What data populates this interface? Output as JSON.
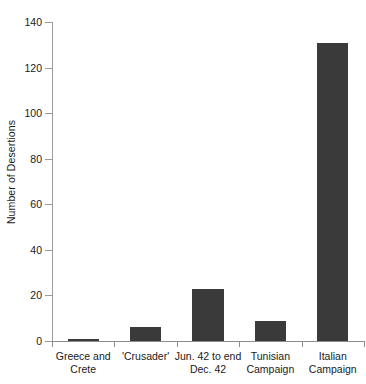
{
  "chart_data": {
    "type": "bar",
    "title": "",
    "xlabel": "",
    "ylabel": "Number of Desertions",
    "ylim": [
      0,
      140
    ],
    "yticks": [
      0,
      20,
      40,
      60,
      80,
      100,
      120,
      140
    ],
    "grid": false,
    "legend": null,
    "bar_color": "#3a3a3a",
    "axis_color": "#8c8c8c",
    "categories": [
      "Greece and Crete",
      "'Crusader'",
      "Jun. 42 to end Dec. 42",
      "Tunisian Campaign",
      "Italian Campaign"
    ],
    "category_lines": [
      [
        "Greece and",
        "Crete"
      ],
      [
        "'Crusader'",
        ""
      ],
      [
        "Jun. 42 to end",
        "Dec. 42"
      ],
      [
        "Tunisian",
        "Campaign"
      ],
      [
        "Italian",
        "Campaign"
      ]
    ],
    "values": [
      1,
      6,
      23,
      9,
      131
    ]
  },
  "axis": {
    "y_title": "Number of Desertions",
    "tick_0": "0",
    "tick_20": "20",
    "tick_40": "40",
    "tick_60": "60",
    "tick_80": "80",
    "tick_100": "100",
    "tick_120": "120",
    "tick_140": "140"
  }
}
